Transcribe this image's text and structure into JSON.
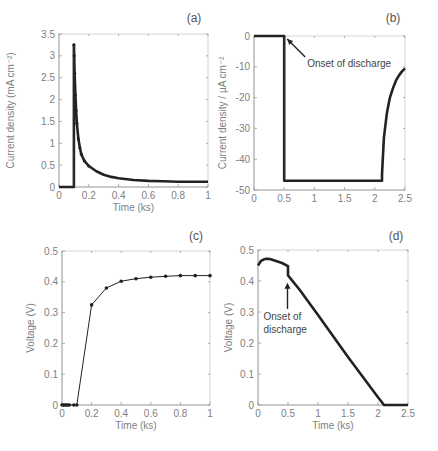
{
  "chart_data": [
    {
      "panel": "(a)",
      "type": "line",
      "title": "",
      "xlabel": "Time (ks)",
      "ylabel": "Current density (mA cm⁻²)",
      "xlim": [
        0,
        1
      ],
      "ylim": [
        0,
        3.5
      ],
      "xticks": [
        0,
        0.2,
        0.4,
        0.6,
        0.8,
        1
      ],
      "xtick_labels": [
        "0",
        "0.2",
        "0.4",
        "0.6",
        "0.8",
        "1"
      ],
      "yticks": [
        0,
        0.5,
        1,
        1.5,
        2,
        2.5,
        3,
        3.5
      ],
      "ytick_labels": [
        "0",
        "0.5",
        "1",
        "1.5",
        "2",
        "2.5",
        "3",
        "3.5"
      ],
      "grid": false,
      "series": [
        {
          "name": "current density",
          "x": [
            0,
            0.02,
            0.04,
            0.06,
            0.08,
            0.1,
            0.1,
            0.102,
            0.105,
            0.11,
            0.115,
            0.12,
            0.13,
            0.14,
            0.15,
            0.17,
            0.2,
            0.25,
            0.3,
            0.35,
            0.4,
            0.5,
            0.6,
            0.7,
            0.8,
            0.9,
            1.0
          ],
          "y": [
            0,
            0,
            0,
            0,
            0,
            0,
            3.25,
            3.0,
            2.6,
            2.1,
            1.75,
            1.45,
            1.1,
            0.9,
            0.75,
            0.6,
            0.48,
            0.36,
            0.28,
            0.23,
            0.2,
            0.16,
            0.14,
            0.13,
            0.12,
            0.12,
            0.12
          ]
        }
      ],
      "annotations": []
    },
    {
      "panel": "(b)",
      "type": "line",
      "title": "",
      "xlabel": "",
      "ylabel": "Current density / µA cm⁻²",
      "xlim": [
        0,
        2.5
      ],
      "ylim": [
        -50,
        0
      ],
      "xticks": [
        0,
        0.5,
        1,
        1.5,
        2,
        2.5
      ],
      "xtick_labels": [
        "0",
        "0.5",
        "1",
        "1.5",
        "2",
        "2.5"
      ],
      "yticks": [
        0,
        -10,
        -20,
        -30,
        -40,
        -50
      ],
      "ytick_labels": [
        "0",
        "-10",
        "-20",
        "-30",
        "-40",
        "-50"
      ],
      "grid": false,
      "series": [
        {
          "name": "current density",
          "x": [
            0,
            0.5,
            0.5,
            0.52,
            1.0,
            1.5,
            2.0,
            2.12,
            2.12,
            2.15,
            2.2,
            2.25,
            2.3,
            2.35,
            2.4,
            2.45,
            2.5
          ],
          "y": [
            0,
            0,
            -47,
            -47,
            -47,
            -47,
            -47,
            -47,
            -45,
            -33,
            -25,
            -20,
            -17,
            -14.5,
            -12.8,
            -11.5,
            -10.5
          ]
        }
      ],
      "annotations": [
        {
          "text": "Onset of discharge",
          "arrow_to": [
            0.5,
            0
          ]
        }
      ]
    },
    {
      "panel": "(c)",
      "type": "line",
      "title": "",
      "xlabel": "Time (ks)",
      "ylabel": "Voltage (V)",
      "xlim": [
        0,
        1
      ],
      "ylim": [
        0,
        0.5
      ],
      "xticks": [
        0,
        0.2,
        0.4,
        0.6,
        0.8,
        1
      ],
      "xtick_labels": [
        "0",
        "0.2",
        "0.4",
        "0.6",
        "0.8",
        "1"
      ],
      "yticks": [
        0,
        0.1,
        0.2,
        0.3,
        0.4,
        0.5
      ],
      "ytick_labels": [
        "0",
        "0.1",
        "0.2",
        "0.3",
        "0.4",
        "0.5"
      ],
      "grid": false,
      "series": [
        {
          "name": "voltage",
          "x": [
            0,
            0.01,
            0.02,
            0.03,
            0.04,
            0.05,
            0.08,
            0.1,
            0.2,
            0.3,
            0.4,
            0.5,
            0.6,
            0.7,
            0.8,
            0.9,
            1.0
          ],
          "y": [
            0,
            0,
            0,
            0,
            0,
            0,
            0,
            0,
            0.325,
            0.38,
            0.402,
            0.41,
            0.415,
            0.418,
            0.42,
            0.42,
            0.42
          ]
        }
      ],
      "annotations": []
    },
    {
      "panel": "(d)",
      "type": "line",
      "title": "",
      "xlabel": "Time (ks)",
      "ylabel": "Voltage (V)",
      "xlim": [
        0,
        2.5
      ],
      "ylim": [
        0,
        0.5
      ],
      "xticks": [
        0,
        0.5,
        1,
        1.5,
        2,
        2.5
      ],
      "xtick_labels": [
        "0",
        "0.5",
        "1",
        "1.5",
        "2",
        "2.5"
      ],
      "yticks": [
        0,
        0.1,
        0.2,
        0.3,
        0.4,
        0.5
      ],
      "ytick_labels": [
        "0",
        "0.1",
        "0.2",
        "0.3",
        "0.4",
        "0.5"
      ],
      "grid": false,
      "series": [
        {
          "name": "voltage",
          "x": [
            0,
            0.05,
            0.1,
            0.15,
            0.2,
            0.3,
            0.4,
            0.5,
            0.5,
            0.7,
            1.0,
            1.5,
            2.0,
            2.1,
            2.2,
            2.5
          ],
          "y": [
            0.45,
            0.465,
            0.47,
            0.472,
            0.471,
            0.465,
            0.458,
            0.448,
            0.418,
            0.37,
            0.29,
            0.155,
            0.025,
            0,
            0,
            0
          ]
        }
      ],
      "annotations": [
        {
          "text": "Onset of\ndischarge",
          "arrow_to": [
            0.5,
            0.42
          ]
        }
      ]
    }
  ],
  "panels": {
    "a": {
      "label": "(a)",
      "xlabel": "Time (ks)",
      "ylabel": "Current density (mA cm⁻²)"
    },
    "b": {
      "label": "(b)",
      "xlabel": "",
      "ylabel": "Current density / µA cm⁻²",
      "annotation": "Onset of discharge"
    },
    "c": {
      "label": "(c)",
      "xlabel": "Time (ks)",
      "ylabel": "Voltage (V)"
    },
    "d": {
      "label": "(d)",
      "xlabel": "Time (ks)",
      "ylabel": "Voltage (V)",
      "annotation_line1": "Onset of",
      "annotation_line2": "discharge"
    }
  }
}
